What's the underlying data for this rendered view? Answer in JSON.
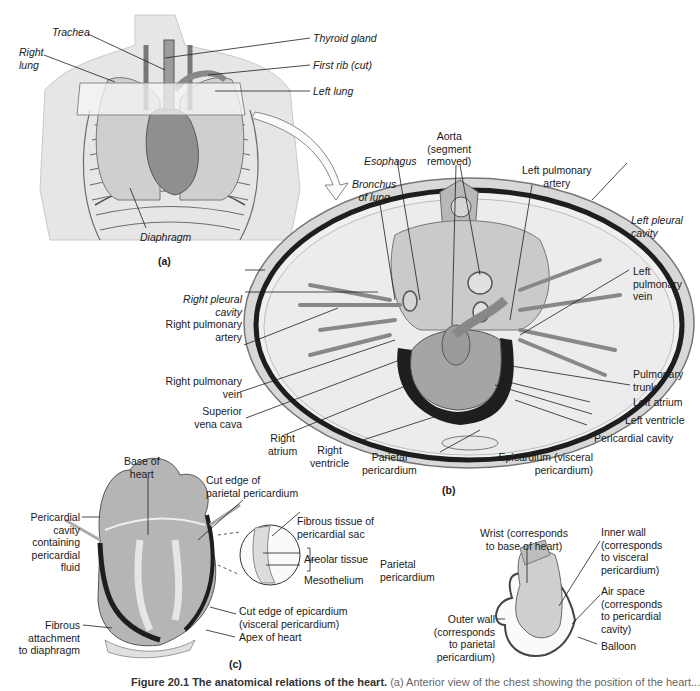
{
  "figure": {
    "panel_a": {
      "tag": "(a)",
      "labels": {
        "trachea": "Trachea",
        "right_lung": [
          "Right",
          "lung"
        ],
        "thyroid_gland": "Thyroid gland",
        "first_rib": "First rib (cut)",
        "left_lung": "Left lung",
        "diaphragm": "Diaphragm"
      }
    },
    "panel_b": {
      "tag": "(b)",
      "labels": {
        "aorta": [
          "Aorta",
          "(segment",
          "removed)"
        ],
        "esophagus": "Esophagus",
        "bronchus": [
          "Bronchus",
          "of lung"
        ],
        "left_pulmonary_artery": [
          "Left pulmonary",
          "artery"
        ],
        "left_pleural_cavity": [
          "Left pleural",
          "cavity"
        ],
        "left_pulmonary_vein": [
          "Left",
          "pulmonary",
          "vein"
        ],
        "right_pleural_cavity": [
          "Right pleural",
          "cavity"
        ],
        "right_pulmonary_artery": [
          "Right pulmonary",
          "artery"
        ],
        "right_pulmonary_vein": [
          "Right pulmonary",
          "vein"
        ],
        "superior_vena_cava": [
          "Superior",
          "vena cava"
        ],
        "right_atrium": [
          "Right",
          "atrium"
        ],
        "right_ventricle": [
          "Right",
          "ventricle"
        ],
        "parietal_pericardium": [
          "Parietal",
          "pericardium"
        ],
        "epicardium": [
          "Epicardium (visceral",
          "pericardium)"
        ],
        "pericardial_cavity": "Pericardial cavity",
        "left_ventricle": "Left ventricle",
        "left_atrium": "Left atrium",
        "pulmonary_trunk": [
          "Pulmonary",
          "trunk"
        ]
      }
    },
    "panel_c": {
      "tag": "(c)",
      "labels": {
        "base_of_heart": [
          "Base of",
          "heart"
        ],
        "cut_edge_parietal": [
          "Cut edge of",
          "parietal pericardium"
        ],
        "pericardial_cavity_fluid": [
          "Pericardial",
          "cavity",
          "containing",
          "pericardial",
          "fluid"
        ],
        "fibrous_tissue": [
          "Fibrous tissue of",
          "pericardial sac"
        ],
        "areolar_tissue": "Areolar tissue",
        "mesothelium": "Mesothelium",
        "parietal_pericardium": [
          "Parietal",
          "pericardium"
        ],
        "cut_edge_epicardium": [
          "Cut edge of epicardium",
          "(visceral pericardium)"
        ],
        "apex_of_heart": "Apex of heart",
        "fibrous_attachment": [
          "Fibrous",
          "attachment",
          "to diaphragm"
        ],
        "wrist": [
          "Wrist (corresponds",
          "to base of heart)"
        ],
        "inner_wall": [
          "Inner wall",
          "(corresponds",
          "to visceral",
          "pericardium)"
        ],
        "air_space": [
          "Air space",
          "(corresponds",
          "to pericardial",
          "cavity)"
        ],
        "outer_wall": [
          "Outer wall",
          "(corresponds",
          "to parietal",
          "pericardium)"
        ],
        "balloon": "Balloon"
      }
    },
    "caption": {
      "title": "Figure 20.1   The anatomical relations of the heart.",
      "rest": " (a) Anterior view of the chest showing the position of the heart..."
    },
    "colors": {
      "skin": "#e4e4e4",
      "tissue_gray": "#9a9a9a",
      "dark_line": "#1e1e1e",
      "lung_fill": "#ececec"
    }
  }
}
